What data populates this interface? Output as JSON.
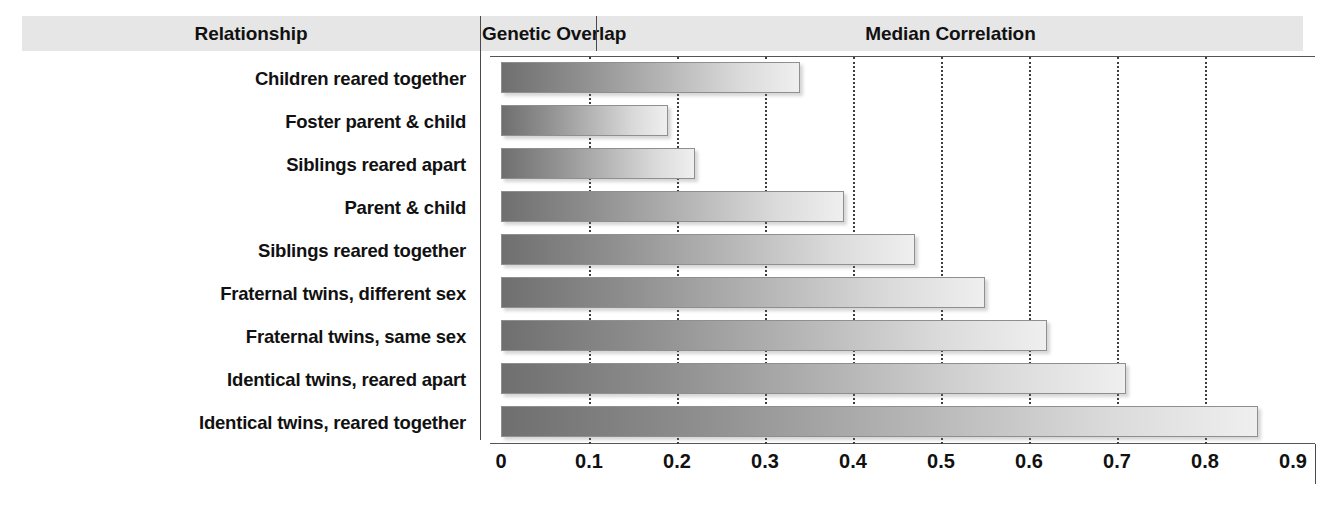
{
  "header": {
    "relationship": "Relationship",
    "genetic_overlap": "Genetic Overlap",
    "median_correlation": "Median Correlation"
  },
  "rows": [
    {
      "label": "Children reared together",
      "overlap": "0%",
      "value": 0.34
    },
    {
      "label": "Foster parent & child",
      "overlap": "0%",
      "value": 0.19
    },
    {
      "label": "Siblings reared apart",
      "overlap": "50%",
      "value": 0.22
    },
    {
      "label": "Parent & child",
      "overlap": "50%",
      "value": 0.39
    },
    {
      "label": "Siblings reared together",
      "overlap": "50%",
      "value": 0.47
    },
    {
      "label": "Fraternal twins, different sex",
      "overlap": "50%",
      "value": 0.55
    },
    {
      "label": "Fraternal twins, same sex",
      "overlap": "50%",
      "value": 0.62
    },
    {
      "label": "Identical twins, reared apart",
      "overlap": "100%",
      "value": 0.71
    },
    {
      "label": "Identical twins, reared together",
      "overlap": "100%",
      "value": 0.86
    }
  ],
  "axis": {
    "ticks": [
      "0",
      "0.1",
      "0.2",
      "0.3",
      "0.4",
      "0.5",
      "0.6",
      "0.7",
      "0.8",
      "0.9"
    ],
    "min": 0,
    "max": 0.9
  },
  "colors": {
    "header_band": "#e6e6e6",
    "bar_start": "#6f6f6f",
    "bar_end": "#efefef",
    "bar_border": "#8f8f8f",
    "rule": "#4a4a4a",
    "text": "#111111"
  },
  "chart_data": {
    "type": "bar",
    "orientation": "horizontal",
    "title": "Median Correlation",
    "xlabel": "",
    "ylabel": "Relationship",
    "xlim": [
      0,
      0.9
    ],
    "grid": true,
    "legend": "none",
    "categories": [
      "Children reared together",
      "Foster parent & child",
      "Siblings reared apart",
      "Parent & child",
      "Siblings reared together",
      "Fraternal twins, different sex",
      "Fraternal twins, same sex",
      "Identical twins, reared apart",
      "Identical twins, reared together"
    ],
    "values": [
      0.34,
      0.19,
      0.22,
      0.39,
      0.47,
      0.55,
      0.62,
      0.71,
      0.86
    ],
    "genetic_overlap": [
      "0%",
      "0%",
      "50%",
      "50%",
      "50%",
      "50%",
      "50%",
      "100%",
      "100%"
    ],
    "xticks": [
      0,
      0.1,
      0.2,
      0.3,
      0.4,
      0.5,
      0.6,
      0.7,
      0.8,
      0.9
    ],
    "xticklabels": [
      "0",
      "0.1",
      "0.2",
      "0.3",
      "0.4",
      "0.5",
      "0.6",
      "0.7",
      "0.8",
      "0.9"
    ],
    "columns": [
      "Relationship",
      "Genetic Overlap",
      "Median Correlation"
    ]
  }
}
